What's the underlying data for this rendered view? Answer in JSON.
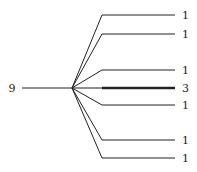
{
  "diagram": {
    "type": "tree-fan",
    "root": {
      "label": "9",
      "x": 12,
      "y": 88
    },
    "hub": {
      "x": 72,
      "y": 88
    },
    "stem": {
      "x1": 22,
      "x2": 72
    },
    "branch_start_x": 102,
    "branch_end_x": 175,
    "label_x": 182,
    "branches": [
      {
        "label": "1",
        "y": 15,
        "weight": 1
      },
      {
        "label": "1",
        "y": 34,
        "weight": 1
      },
      {
        "label": "1",
        "y": 70,
        "weight": 1
      },
      {
        "label": "3",
        "y": 88,
        "weight": 3
      },
      {
        "label": "1",
        "y": 105,
        "weight": 1
      },
      {
        "label": "1",
        "y": 140,
        "weight": 1
      },
      {
        "label": "1",
        "y": 158,
        "weight": 1
      }
    ],
    "colors": {
      "line": "#222222",
      "text": "#222222"
    }
  }
}
